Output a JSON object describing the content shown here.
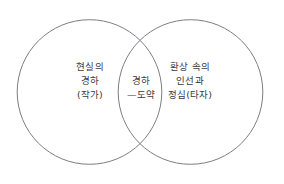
{
  "figure": {
    "type": "venn-diagram",
    "background_color": "#ffffff",
    "stroke_color": "#7d7d85",
    "text_color": "#3a3a3c"
  },
  "left_circle": {
    "region_name": "left-set",
    "lines": [
      "현실의",
      "경하",
      "(작가)"
    ],
    "line1": "현실의",
    "line2": "경하",
    "line3": "(작가)"
  },
  "intersection": {
    "region_name": "intersection-set",
    "lines": [
      "경하",
      "—도약"
    ],
    "line1": "경하",
    "line2": "—도약"
  },
  "right_circle": {
    "region_name": "right-set",
    "lines": [
      "환상 속의",
      "인선과",
      "정심(타자)"
    ],
    "line1": "환상 속의",
    "line2": "인선과",
    "line3": "정심(타자)"
  }
}
